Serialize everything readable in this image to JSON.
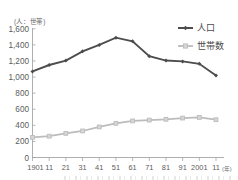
{
  "chart_data": {
    "type": "line",
    "title": "",
    "subtitle": "",
    "xlabel": "年",
    "ylabel": "(人：世帯)",
    "y_unit_label": "(人：世帯)",
    "x_unit_label": "(年)",
    "categories": [
      "1901",
      "11",
      "21",
      "31",
      "41",
      "51",
      "61",
      "71",
      "81",
      "91",
      "2001",
      "11"
    ],
    "xtick_labels": [
      "1901",
      "11",
      "21",
      "31",
      "41",
      "51",
      "61",
      "71",
      "81",
      "91",
      "2001",
      "11"
    ],
    "ytick_labels": [
      "0",
      "200",
      "400",
      "600",
      "800",
      "1,000",
      "1,200",
      "1,400",
      "1,600"
    ],
    "yticks": [
      0,
      200,
      400,
      600,
      800,
      1000,
      1200,
      1400,
      1600
    ],
    "ylim": [
      0,
      1600
    ],
    "grid": false,
    "legend_position": "top-right",
    "series": [
      {
        "name": "人口",
        "color": "#4d4d4d",
        "marker": "diamond",
        "values": [
          1070,
          1150,
          1205,
          1320,
          1400,
          1490,
          1445,
          1260,
          1205,
          1195,
          1165,
          1020
        ]
      },
      {
        "name": "世帯数",
        "color": "#bcbcbc",
        "marker": "square",
        "values": [
          250,
          265,
          300,
          330,
          380,
          425,
          455,
          465,
          475,
          490,
          498,
          470
        ]
      }
    ]
  },
  "legend": {
    "items": [
      {
        "label": "人口",
        "color": "#4d4d4d"
      },
      {
        "label": "世帯数",
        "color": "#bcbcbc"
      }
    ]
  },
  "colors": {
    "population": "#4d4d4d",
    "households": "#bcbcbc",
    "axis": "#9a9a9a",
    "text": "#5c5c5c",
    "background": "#ffffff"
  }
}
